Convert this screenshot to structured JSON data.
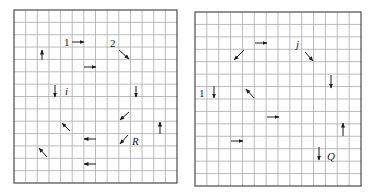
{
  "figures": [
    {
      "id": "left",
      "grid": {
        "x0": 14,
        "y0": 10,
        "x1": 177,
        "y1": 183,
        "cols": 14,
        "rows": 14
      },
      "arrows": [
        {
          "name": "arrow-1-right",
          "x1": 72,
          "y1": 42,
          "x2": 84,
          "y2": 42
        },
        {
          "name": "arrow-2-down-right",
          "x1": 119,
          "y1": 50,
          "x2": 129,
          "y2": 59
        },
        {
          "name": "arrow-up-a",
          "x1": 42,
          "y1": 60,
          "x2": 42,
          "y2": 50
        },
        {
          "name": "arrow-right-a",
          "x1": 84,
          "y1": 67,
          "x2": 96,
          "y2": 67
        },
        {
          "name": "arrow-i-down",
          "x1": 55,
          "y1": 85,
          "x2": 55,
          "y2": 97
        },
        {
          "name": "arrow-down-b",
          "x1": 136,
          "y1": 86,
          "x2": 136,
          "y2": 97
        },
        {
          "name": "arrow-down-left-a",
          "x1": 129,
          "y1": 112,
          "x2": 120,
          "y2": 120
        },
        {
          "name": "arrow-up-left-a",
          "x1": 70,
          "y1": 131,
          "x2": 62,
          "y2": 123
        },
        {
          "name": "arrow-up-b",
          "x1": 160,
          "y1": 134,
          "x2": 160,
          "y2": 122
        },
        {
          "name": "arrow-left-a",
          "x1": 96,
          "y1": 139,
          "x2": 84,
          "y2": 139
        },
        {
          "name": "arrow-R-down-left",
          "x1": 128,
          "y1": 135,
          "x2": 120,
          "y2": 144
        },
        {
          "name": "arrow-up-left-b",
          "x1": 47,
          "y1": 157,
          "x2": 39,
          "y2": 148
        },
        {
          "name": "arrow-left-b",
          "x1": 96,
          "y1": 164,
          "x2": 84,
          "y2": 164
        }
      ],
      "labels": [
        {
          "name": "label-1",
          "text": "1",
          "x": 64,
          "y": 46,
          "italic": false
        },
        {
          "name": "label-2",
          "text": "2",
          "x": 110,
          "y": 47,
          "italic": false
        },
        {
          "name": "label-i",
          "text": "i",
          "x": 65,
          "y": 95,
          "italic": true
        },
        {
          "name": "label-R",
          "text": "R",
          "x": 132,
          "y": 145,
          "italic": true
        }
      ]
    },
    {
      "id": "right",
      "grid": {
        "x0": 195,
        "y0": 12,
        "x1": 361,
        "y1": 186,
        "cols": 14,
        "rows": 14
      },
      "arrows": [
        {
          "name": "arrow-right-top",
          "x1": 255,
          "y1": 43,
          "x2": 267,
          "y2": 43
        },
        {
          "name": "arrow-down-left-top",
          "x1": 244,
          "y1": 50,
          "x2": 234,
          "y2": 60
        },
        {
          "name": "arrow-j-down-right",
          "x1": 305,
          "y1": 52,
          "x2": 313,
          "y2": 61
        },
        {
          "name": "arrow-down-right-side",
          "x1": 331,
          "y1": 75,
          "x2": 331,
          "y2": 88
        },
        {
          "name": "arrow-1-down",
          "x1": 214,
          "y1": 86,
          "x2": 214,
          "y2": 98
        },
        {
          "name": "arrow-up-left-mid",
          "x1": 254,
          "y1": 98,
          "x2": 246,
          "y2": 89
        },
        {
          "name": "arrow-right-mid",
          "x1": 267,
          "y1": 117,
          "x2": 279,
          "y2": 117
        },
        {
          "name": "arrow-up-right-side",
          "x1": 343,
          "y1": 136,
          "x2": 343,
          "y2": 123
        },
        {
          "name": "arrow-right-low",
          "x1": 231,
          "y1": 141,
          "x2": 243,
          "y2": 141
        },
        {
          "name": "arrow-Q-down",
          "x1": 319,
          "y1": 147,
          "x2": 319,
          "y2": 160
        }
      ],
      "labels": [
        {
          "name": "label-j",
          "text": "j",
          "x": 296,
          "y": 48,
          "italic": true
        },
        {
          "name": "label-1",
          "text": "1",
          "x": 199,
          "y": 97,
          "italic": false
        },
        {
          "name": "label-Q",
          "text": "Q",
          "x": 327,
          "y": 160,
          "italic": true
        }
      ]
    }
  ]
}
